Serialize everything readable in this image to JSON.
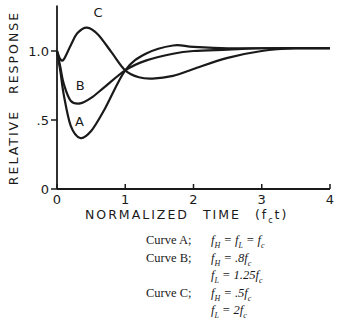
{
  "chart_data": {
    "type": "line",
    "title": "",
    "xlabel": "NORMALIZED TIME (f_c t)",
    "ylabel": "RELATIVE RESPONSE",
    "xlim": [
      0,
      4
    ],
    "ylim": [
      0,
      1.25
    ],
    "x_ticks": [
      "0",
      "1",
      "2",
      "3",
      "4"
    ],
    "y_ticks": [
      "0",
      ".5",
      "1.0"
    ],
    "grid": false,
    "series": [
      {
        "name": "A",
        "x": [
          0,
          0.05,
          0.1,
          0.2,
          0.34,
          0.5,
          0.7,
          1.0,
          1.3,
          1.7,
          2.0,
          2.5,
          3.0,
          4.0
        ],
        "y": [
          1.0,
          0.85,
          0.68,
          0.46,
          0.37,
          0.42,
          0.58,
          0.86,
          0.98,
          1.04,
          1.03,
          1.02,
          1.02,
          1.02
        ]
      },
      {
        "name": "B",
        "x": [
          0,
          0.05,
          0.1,
          0.2,
          0.34,
          0.5,
          0.7,
          1.0,
          1.3,
          1.7,
          2.0,
          2.5,
          3.0,
          4.0
        ],
        "y": [
          1.0,
          0.88,
          0.76,
          0.64,
          0.62,
          0.66,
          0.74,
          0.86,
          0.93,
          0.98,
          1.0,
          1.01,
          1.02,
          1.02
        ]
      },
      {
        "name": "C",
        "x": [
          0,
          0.05,
          0.1,
          0.2,
          0.3,
          0.44,
          0.6,
          0.8,
          1.0,
          1.2,
          1.4,
          1.7,
          2.0,
          2.5,
          3.0,
          3.5,
          4.0
        ],
        "y": [
          1.0,
          0.94,
          0.94,
          1.04,
          1.13,
          1.17,
          1.12,
          0.99,
          0.86,
          0.81,
          0.8,
          0.82,
          0.87,
          0.95,
          1.0,
          1.02,
          1.02
        ]
      }
    ],
    "annotations": [
      {
        "text": "A",
        "x": 0.33,
        "y": 0.46
      },
      {
        "text": "B",
        "x": 0.34,
        "y": 0.72
      },
      {
        "text": "C",
        "x": 0.6,
        "y": 1.25
      }
    ],
    "legend_lines": [
      {
        "curve": "Curve A;",
        "eq": [
          "f_H = f_L = f_c"
        ]
      },
      {
        "curve": "Curve B;",
        "eq": [
          "f_H = .8f_c",
          "f_L = 1.25f_c"
        ]
      },
      {
        "curve": "Curve C;",
        "eq": [
          "f_H = .5f_c",
          "f_L = 2f_c"
        ]
      }
    ]
  },
  "labels": {
    "ylabel": "RELATIVE RESPONSE",
    "xlabel": "NORMALIZED TIME (fct)",
    "legend": {
      "a_name": "Curve A;",
      "a_eq": "fH = fL = fc",
      "b_name": "Curve B;",
      "b_eq1": "fH = .8fc",
      "b_eq2": "fL = 1.25fc",
      "c_name": "Curve C;",
      "c_eq1": "fH = .5fc",
      "c_eq2": "fL = 2fc"
    }
  }
}
